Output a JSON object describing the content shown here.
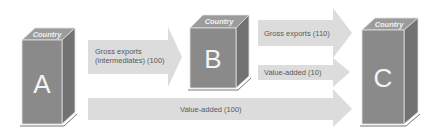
{
  "diagram": {
    "type": "trade-flow",
    "colors": {
      "box_front": "#8a8a8a",
      "box_top": "#9c9c9c",
      "box_side": "#727272",
      "arrow_fill": "#dcdcdc",
      "label_text": "#5a5a5a"
    },
    "countries": [
      {
        "id": "A",
        "letter": "A",
        "top_label": "Country"
      },
      {
        "id": "B",
        "letter": "B",
        "top_label": "Country"
      },
      {
        "id": "C",
        "letter": "C",
        "top_label": "Country"
      }
    ],
    "flows": [
      {
        "from": "A",
        "to": "B",
        "label_line1": "Gross exports",
        "label_line2": "(intermediates) (100)"
      },
      {
        "from": "B",
        "to": "C",
        "label": "Gross exports (110)"
      },
      {
        "from": "B",
        "to": "C",
        "label": "Value-added (10)"
      },
      {
        "from": "A",
        "to": "C",
        "label": "Value-added (100)"
      }
    ]
  }
}
